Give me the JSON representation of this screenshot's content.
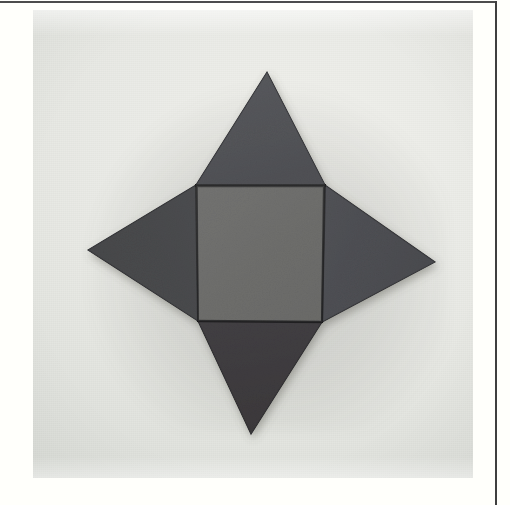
{
  "page": {
    "background_color": "#fffffb",
    "rule_color": "#4c4c4c",
    "caption": ""
  },
  "photo": {
    "alt": "Photograph of a four-pointed star made from a gray square tile with four gray triangular tiles attached to its sides",
    "background_color": "#e9eae5",
    "surface_description": "plain light gray tabletop"
  },
  "figure": {
    "name": "square-pyramid-net",
    "description": "Net of a square pyramid: a central square with one triangle on each of its four edges, laid flat to form a four-pointed star",
    "piece_count": 5,
    "material": "gray foam tiles",
    "colors": {
      "square_fill": "#6f6f6d",
      "triangle_top_fill": "#55565a",
      "triangle_right_fill": "#4f5054",
      "triangle_left_fill": "#4a4b4d",
      "triangle_bottom_fill": "#3f3c3e",
      "seam": "#1c1c1e"
    },
    "pieces": [
      {
        "id": "center-square",
        "label": "center square",
        "shape": "square",
        "fill": "#6f6f6d",
        "points": "163,175 292,175 289,312 165,311"
      },
      {
        "id": "top-triangle",
        "label": "top triangle",
        "shape": "triangle",
        "fill": "#55565a",
        "points": "163,175 292,175 234,62"
      },
      {
        "id": "right-triangle",
        "label": "right triangle",
        "shape": "triangle",
        "fill": "#4f5054",
        "points": "292,175 289,312 402,252"
      },
      {
        "id": "bottom-triangle",
        "label": "bottom triangle",
        "shape": "triangle",
        "fill": "#3f3c3e",
        "points": "165,311 289,312 218,424"
      },
      {
        "id": "left-triangle",
        "label": "left triangle",
        "shape": "triangle",
        "fill": "#4a4b4d",
        "points": "163,175 165,311 55,240"
      }
    ]
  }
}
